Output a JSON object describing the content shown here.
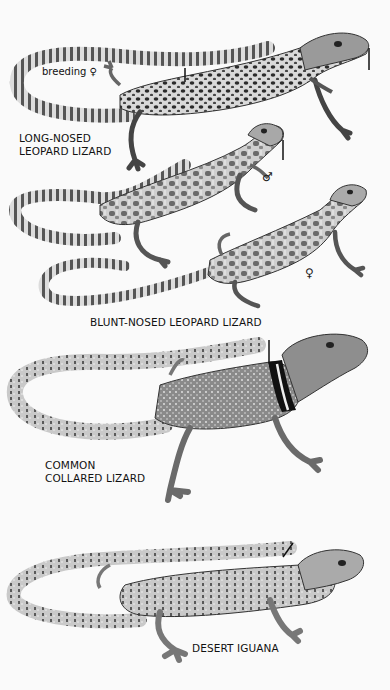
{
  "plate": {
    "background": "#fafafa",
    "ink": "#111111"
  },
  "species": [
    {
      "name": "LONG-NOSED\nLEOPARD LIZARD",
      "annotations": [
        {
          "text": "breeding ♀"
        }
      ],
      "label_pos": [
        18,
        132
      ]
    },
    {
      "name": "BLUNT-NOSED LEOPARD LIZARD",
      "annotations": [
        {
          "text": "♂"
        },
        {
          "text": "♀"
        }
      ],
      "label_pos": [
        90,
        318
      ]
    },
    {
      "name": "COMMON\nCOLLARED LIZARD",
      "annotations": [],
      "label_pos": [
        45,
        460
      ]
    },
    {
      "name": "DESERT IGUANA",
      "annotations": [],
      "label_pos": [
        192,
        643
      ]
    }
  ],
  "labels": {
    "long_nosed": "LONG-NOSED\nLEOPARD LIZARD",
    "breeding_female": "breeding ♀",
    "blunt_nosed": "BLUNT-NOSED LEOPARD LIZARD",
    "male_symbol": "♂",
    "female_symbol": "♀",
    "collared": "COMMON\nCOLLARED LIZARD",
    "desert_iguana": "DESERT IGUANA"
  }
}
